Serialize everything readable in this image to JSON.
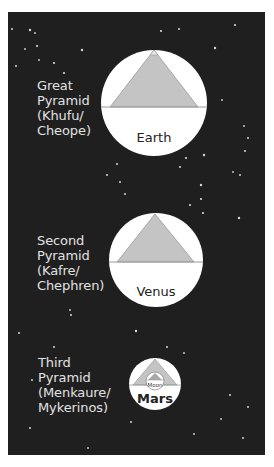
{
  "colors": {
    "background_outer": "#ffffff",
    "space": "#1f1f1f",
    "planet_fill": "#ffffff",
    "pyramid_fill": "#c4c4c4",
    "pyramid_stroke": "#9a9a9a",
    "label_text": "#e2e2e2",
    "planet_text": "#222222"
  },
  "comparisons": [
    {
      "pyramid_lines": [
        "Great",
        "Pyramid",
        "(Khufu/",
        "Cheope)"
      ],
      "planet": "Earth"
    },
    {
      "pyramid_lines": [
        "Second",
        "Pyramid",
        "(Kafre/",
        "Chephren)"
      ],
      "planet": "Venus"
    },
    {
      "pyramid_lines": [
        "Third",
        "Pyramid",
        "(Menkaure/",
        "Mykerinos)"
      ],
      "planet": "Mars",
      "inset": "Moon"
    }
  ]
}
